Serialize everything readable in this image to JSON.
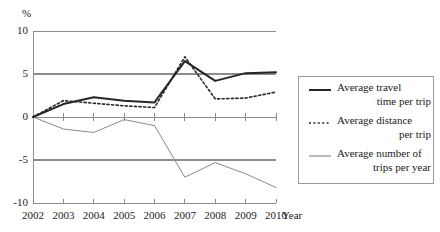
{
  "chart_data": {
    "type": "line",
    "title": "",
    "xlabel": "Year",
    "ylabel": "%",
    "ylim": [
      -10,
      10
    ],
    "yticks": [
      10,
      5,
      0,
      -5,
      -10
    ],
    "ytick_labels": [
      "10",
      "5",
      "0",
      "-5",
      "-10"
    ],
    "grid": true,
    "gridlines_at": [
      10,
      5,
      0,
      -5,
      -10
    ],
    "legend_position": "right-outside",
    "categories": [
      2002,
      2003,
      2004,
      2005,
      2006,
      2007,
      2008,
      2009,
      2010
    ],
    "xtick_labels": [
      "2002",
      "2003",
      "2004",
      "2005",
      "2006",
      "2007",
      "2008",
      "2009",
      "2010"
    ],
    "series": [
      {
        "name": "Average travel time per trip",
        "style": "solid",
        "color": "#262626",
        "width": 2.0,
        "values": [
          0,
          1.5,
          2.3,
          1.9,
          1.7,
          6.5,
          4.2,
          5.1,
          5.2
        ]
      },
      {
        "name": "Average distance per trip",
        "style": "dotted",
        "color": "#262626",
        "width": 1.6,
        "values": [
          0,
          1.9,
          1.6,
          1.3,
          1.1,
          7.0,
          2.1,
          2.2,
          2.9
        ]
      },
      {
        "name": "Average number of trips per year",
        "style": "solid",
        "color": "#8a8a8a",
        "width": 1.0,
        "values": [
          0,
          -1.4,
          -1.8,
          -0.3,
          -1.0,
          -7.0,
          -5.3,
          -6.6,
          -8.2
        ]
      }
    ]
  },
  "axes": {
    "y_unit_label": "%",
    "x_axis_title": "Year"
  },
  "legend": {
    "entries": [
      {
        "line1": "Average travel",
        "line2": "time per trip",
        "marker": "solid-line-icon"
      },
      {
        "line1": "Average distance",
        "line2": "per trip",
        "marker": "dotted-line-icon"
      },
      {
        "line1": "Average number of",
        "line2": "trips per year",
        "marker": "gray-line-icon"
      }
    ]
  },
  "colors": {
    "series_primary": "#262626",
    "series_secondary": "#8a8a8a",
    "gridline": "#8c8c8c",
    "axis": "#8c8c8c",
    "legend_border": "#9a9a9a"
  }
}
